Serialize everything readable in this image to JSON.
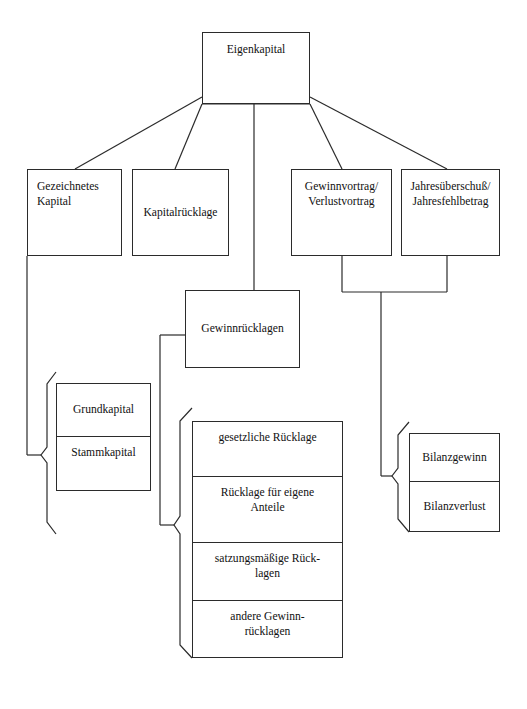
{
  "diagram": {
    "title": "Eigenkapital",
    "language": "de",
    "stroke_color": "#2b2b2b",
    "background_color": "#ffffff",
    "nodes": {
      "root": {
        "label": "Eigenkapital"
      },
      "gezeichnetes_kapital": {
        "label": "Gezeichnetes\nKapital"
      },
      "kapitalruecklage": {
        "label": "Kapitalrücklage"
      },
      "gewinnvortrag": {
        "label": "Gewinnvortrag/\nVerlustvortrag"
      },
      "jahresueberschuss": {
        "label": "Jahresüberschuß/\nJahresfehlbetrag"
      },
      "gewinnruecklagen": {
        "label": "Gewinnrücklagen"
      }
    },
    "groups": {
      "kapital_arten": {
        "items": [
          {
            "label": "Grundkapital"
          },
          {
            "label": "Stammkapital"
          }
        ]
      },
      "ruecklagen_arten": {
        "items": [
          {
            "label": "gesetzliche Rücklage"
          },
          {
            "label": "Rücklage für eigene\nAnteile"
          },
          {
            "label": "satzungsmäßige Rück-\nlagen"
          },
          {
            "label": "andere Gewinn-\nrücklagen"
          }
        ]
      },
      "bilanz_ergebnis": {
        "items": [
          {
            "label": "Bilanzgewinn"
          },
          {
            "label": "Bilanzverlust"
          }
        ]
      }
    }
  }
}
